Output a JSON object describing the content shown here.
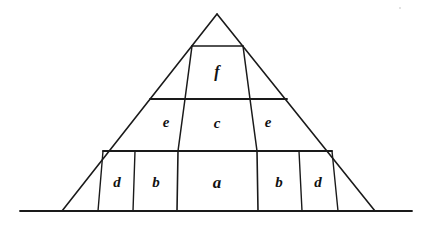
{
  "figure": {
    "background_color": "#ffffff",
    "ink_color": "#1a1a1a",
    "canvas": {
      "width": 429,
      "height": 227
    },
    "apex": {
      "x": 217,
      "y": 14
    },
    "baseline": {
      "x1": 20,
      "y1": 211,
      "x2": 412,
      "y2": 211
    },
    "outline": {
      "left_foot": {
        "x": 62,
        "y": 211
      },
      "right_foot": {
        "x": 375,
        "y": 211
      }
    },
    "horizontal_dividers": [
      {
        "name": "top-divider",
        "x1": 192,
        "y1": 46,
        "x2": 243,
        "y2": 46
      },
      {
        "name": "upper-divider",
        "x1": 150,
        "y1": 99,
        "x2": 287,
        "y2": 99
      },
      {
        "name": "lower-divider",
        "x1": 103,
        "y1": 151,
        "x2": 332,
        "y2": 151
      }
    ],
    "slanted_dividers": [
      {
        "name": "divider-f-left",
        "x1": 192,
        "y1": 46,
        "x2": 185,
        "y2": 99
      },
      {
        "name": "divider-f-right",
        "x1": 243,
        "y1": 46,
        "x2": 250,
        "y2": 99
      },
      {
        "name": "divider-c-left",
        "x1": 185,
        "y1": 99,
        "x2": 178,
        "y2": 151
      },
      {
        "name": "divider-c-right",
        "x1": 250,
        "y1": 99,
        "x2": 257,
        "y2": 151
      },
      {
        "name": "divider-a-left",
        "x1": 178,
        "y1": 151,
        "x2": 177,
        "y2": 211
      },
      {
        "name": "divider-a-right",
        "x1": 257,
        "y1": 151,
        "x2": 258,
        "y2": 211
      },
      {
        "name": "divider-b-left",
        "x1": 135,
        "y1": 151,
        "x2": 133,
        "y2": 211
      },
      {
        "name": "divider-b-right",
        "x1": 299,
        "y1": 151,
        "x2": 302,
        "y2": 211
      },
      {
        "name": "divider-d-left",
        "x1": 103,
        "y1": 151,
        "x2": 98,
        "y2": 211
      },
      {
        "name": "divider-d-right",
        "x1": 332,
        "y1": 151,
        "x2": 338,
        "y2": 211
      }
    ],
    "regions": [
      {
        "id": "region-a",
        "label": "a",
        "x": 217,
        "y": 184,
        "font_size": 17,
        "row": "bottom"
      },
      {
        "id": "region-b-left",
        "label": "b",
        "x": 156,
        "y": 184,
        "font_size": 15,
        "row": "bottom"
      },
      {
        "id": "region-b-right",
        "label": "b",
        "x": 279,
        "y": 184,
        "font_size": 15,
        "row": "bottom"
      },
      {
        "id": "region-d-left",
        "label": "d",
        "x": 117,
        "y": 184,
        "font_size": 15,
        "row": "bottom"
      },
      {
        "id": "region-d-right",
        "label": "d",
        "x": 318,
        "y": 184,
        "font_size": 15,
        "row": "bottom"
      },
      {
        "id": "region-c",
        "label": "c",
        "x": 217,
        "y": 125,
        "font_size": 15,
        "row": "middle"
      },
      {
        "id": "region-e-left",
        "label": "e",
        "x": 166,
        "y": 124,
        "font_size": 15,
        "row": "middle"
      },
      {
        "id": "region-e-right",
        "label": "e",
        "x": 268,
        "y": 124,
        "font_size": 15,
        "row": "middle"
      },
      {
        "id": "region-f",
        "label": "f",
        "x": 217,
        "y": 73,
        "font_size": 16,
        "row": "top"
      }
    ]
  }
}
